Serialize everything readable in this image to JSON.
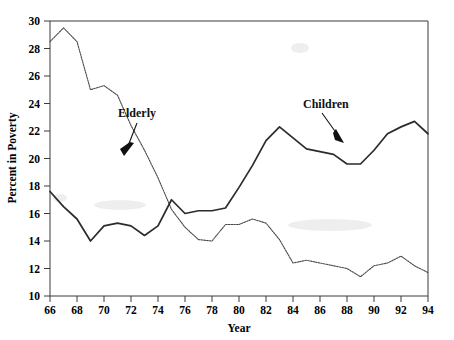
{
  "chart_data": {
    "type": "line",
    "title": "",
    "xlabel": "Year",
    "ylabel": "Percent in Poverty",
    "xlim": [
      66,
      94
    ],
    "ylim": [
      10,
      30
    ],
    "xticks": [
      66,
      68,
      70,
      72,
      74,
      76,
      78,
      80,
      82,
      84,
      86,
      88,
      90,
      92,
      94
    ],
    "yticks": [
      10,
      12,
      14,
      16,
      18,
      20,
      22,
      24,
      26,
      28,
      30
    ],
    "xtick_labels": [
      "66",
      "68",
      "70",
      "72",
      "74",
      "76",
      "78",
      "80",
      "82",
      "84",
      "86",
      "88",
      "90",
      "92",
      "94"
    ],
    "ytick_labels": [
      "10",
      "12",
      "14",
      "16",
      "18",
      "20",
      "22",
      "24",
      "26",
      "28",
      "30"
    ],
    "grid": false,
    "legend": "inline-annotations",
    "x": [
      66,
      67,
      68,
      69,
      70,
      71,
      72,
      73,
      74,
      75,
      76,
      77,
      78,
      79,
      80,
      81,
      82,
      83,
      84,
      85,
      86,
      87,
      88,
      89,
      90,
      91,
      92,
      93,
      94
    ],
    "series": [
      {
        "name": "Elderly",
        "style": "dotted",
        "color": "#4a4a4a",
        "values": [
          28.5,
          29.5,
          28.5,
          25.0,
          25.3,
          24.6,
          22.4,
          20.6,
          18.6,
          16.3,
          15.0,
          14.1,
          14.0,
          15.2,
          15.2,
          15.6,
          15.3,
          14.1,
          12.4,
          12.6,
          12.4,
          12.2,
          12.0,
          11.4,
          12.2,
          12.4,
          12.9,
          12.2,
          11.7
        ]
      },
      {
        "name": "Children",
        "style": "solid",
        "color": "#2b2b2b",
        "values": [
          17.6,
          16.5,
          15.6,
          14.0,
          15.1,
          15.3,
          15.1,
          14.4,
          15.1,
          17.0,
          16.0,
          16.2,
          16.2,
          16.4,
          17.9,
          19.5,
          21.3,
          22.3,
          21.5,
          20.7,
          20.5,
          20.3,
          19.6,
          19.6,
          20.6,
          21.8,
          22.3,
          22.7,
          21.8
        ]
      }
    ],
    "annotations": [
      {
        "text": "Elderly",
        "points_to_series": "Elderly",
        "near_x": 73
      },
      {
        "text": "Children",
        "points_to_series": "Children",
        "near_x": 85
      }
    ]
  }
}
